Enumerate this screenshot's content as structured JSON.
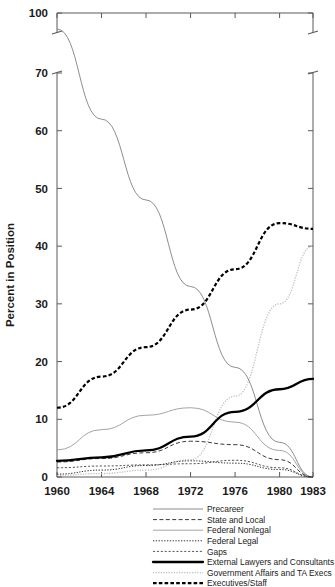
{
  "chart_data": {
    "type": "line",
    "title": "",
    "xlabel": "",
    "ylabel": "Percent in Position",
    "x": [
      1960,
      1964,
      1968,
      1972,
      1976,
      1980,
      1983
    ],
    "xlim": [
      1960,
      1983
    ],
    "ylim": [
      0,
      100
    ],
    "y_axis_break": {
      "between": [
        70,
        100
      ],
      "style": "double-hash"
    },
    "xticks": [
      "1960",
      "1964",
      "1968",
      "1972",
      "1976",
      "1980",
      "1983"
    ],
    "yticks": [
      "0",
      "10",
      "20",
      "30",
      "40",
      "50",
      "60",
      "70",
      "100"
    ],
    "ytick_values": [
      0,
      10,
      20,
      30,
      40,
      50,
      60,
      70,
      100
    ],
    "grid": false,
    "legend_position": "bottom-center",
    "series": [
      {
        "name": "Precareer",
        "style": "thin-solid-gray",
        "color": "#808080",
        "values": [
          76,
          62,
          48,
          33,
          19,
          6,
          0
        ]
      },
      {
        "name": "State and Local",
        "style": "dashed-thin-dark",
        "color": "#3a3a3a",
        "values": [
          2.6,
          3.2,
          4.2,
          6.2,
          5.6,
          3.0,
          0
        ]
      },
      {
        "name": "Federal Nonlegal",
        "style": "thin-solid-light-gray",
        "color": "#9a9a9a",
        "values": [
          4.7,
          8.2,
          10.7,
          12.0,
          9.5,
          4.6,
          0
        ]
      },
      {
        "name": "Federal Legal",
        "style": "fine-dotted-dark",
        "color": "#2e2e2e",
        "values": [
          0.5,
          1.2,
          2.0,
          2.8,
          2.4,
          1.3,
          0
        ]
      },
      {
        "name": "Gaps",
        "style": "dotted-medium",
        "color": "#555555",
        "values": [
          1.6,
          1.9,
          2.1,
          2.3,
          2.9,
          1.6,
          0
        ]
      },
      {
        "name": "External Lawyers and Consultants",
        "style": "thick-solid-black",
        "color": "#000000",
        "values": [
          2.8,
          3.4,
          4.6,
          7.0,
          11.3,
          15.2,
          17.0
        ]
      },
      {
        "name": "Government Affairs and TA Execs",
        "style": "faint-dotted-light",
        "color": "#bdbdbd",
        "values": [
          0.3,
          0.6,
          1.2,
          3.0,
          14.0,
          30.0,
          40.0
        ]
      },
      {
        "name": "Executives/Staff",
        "style": "bold-dashed-black",
        "color": "#000000",
        "values": [
          12.0,
          17.4,
          22.5,
          29.0,
          36.0,
          44.0,
          43.0
        ]
      }
    ]
  },
  "legend": {
    "items": [
      {
        "label": "Precareer",
        "swatch": "thin-solid-gray"
      },
      {
        "label": "State and Local",
        "swatch": "dashed-thin-dark"
      },
      {
        "label": "Federal Nonlegal",
        "swatch": "thin-solid-light-gray"
      },
      {
        "label": "Federal Legal",
        "swatch": "fine-dotted-dark"
      },
      {
        "label": "Gaps",
        "swatch": "dotted-medium"
      },
      {
        "label": "External Lawyers and Consultants",
        "swatch": "thick-solid-black"
      },
      {
        "label": "Government Affairs and TA Execs",
        "swatch": "faint-dotted-light"
      },
      {
        "label": "Executives/Staff",
        "swatch": "bold-dashed-black"
      }
    ]
  },
  "colors": {
    "axis": "#5a5a5a",
    "text": "#1a1a1a",
    "background": "#ffffff"
  }
}
